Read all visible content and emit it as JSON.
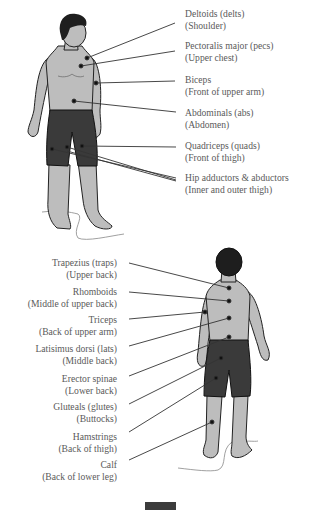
{
  "front_view": {
    "labels": [
      {
        "name": "Deltoids (delts)",
        "desc": "(Shoulder)"
      },
      {
        "name": "Pectoralis major (pecs)",
        "desc": "(Upper chest)"
      },
      {
        "name": "Biceps",
        "desc": "(Front of upper arm)"
      },
      {
        "name": "Abdominals (abs)",
        "desc": "(Abdomen)"
      },
      {
        "name": "Quadriceps (quads)",
        "desc": "(Front of thigh)"
      },
      {
        "name": "Hip adductors & abductors",
        "desc": "(Inner and outer thigh)"
      }
    ]
  },
  "back_view": {
    "labels": [
      {
        "name": "Trapezius (traps)",
        "desc": "(Upper back)"
      },
      {
        "name": "Rhomboids",
        "desc": "(Middle of upper back)"
      },
      {
        "name": "Triceps",
        "desc": "(Back of upper arm)"
      },
      {
        "name": "Latisimus dorsi (lats)",
        "desc": "(Middle back)"
      },
      {
        "name": "Erector spinae",
        "desc": "(Lower back)"
      },
      {
        "name": "Gluteals (glutes)",
        "desc": "(Buttocks)"
      },
      {
        "name": "Hamstrings",
        "desc": "(Back of thigh)"
      },
      {
        "name": "Calf",
        "desc": "(Back of lower leg)"
      }
    ]
  },
  "colors": {
    "skin": "#bdbdbd",
    "shorts": "#3a3a3a",
    "hair": "#1e1e1e",
    "leader_line": "#333333",
    "text": "#5a5a5a"
  }
}
